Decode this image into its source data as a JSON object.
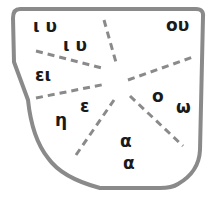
{
  "diagram": {
    "type": "partitioned-shape",
    "border_color": "#8a8a8a",
    "divider_color": "#8a8a8a",
    "text_color": "#1a1a1a",
    "labels": [
      {
        "id": "iu-1",
        "text": "ι υ",
        "x": 33,
        "y": 18
      },
      {
        "id": "iu-2",
        "text": "ι υ",
        "x": 63,
        "y": 37
      },
      {
        "id": "ou",
        "text": "ου",
        "x": 166,
        "y": 17
      },
      {
        "id": "ei",
        "text": "ει",
        "x": 35,
        "y": 67
      },
      {
        "id": "epsilon",
        "text": "ε",
        "x": 80,
        "y": 98
      },
      {
        "id": "eta",
        "text": "η",
        "x": 55,
        "y": 112
      },
      {
        "id": "omicron",
        "text": "ο",
        "x": 152,
        "y": 88
      },
      {
        "id": "omega",
        "text": "ω",
        "x": 176,
        "y": 99
      },
      {
        "id": "alpha-1",
        "text": "α",
        "x": 120,
        "y": 133
      },
      {
        "id": "alpha-2",
        "text": "α",
        "x": 123,
        "y": 155
      }
    ]
  }
}
